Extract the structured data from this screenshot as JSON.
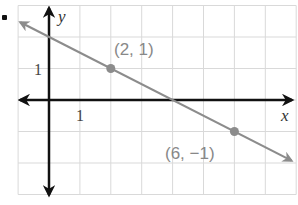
{
  "chart_data": {
    "type": "line",
    "title": "",
    "xlabel": "x",
    "ylabel": "y",
    "xlim": [
      -1,
      8
    ],
    "ylim": [
      -3,
      3
    ],
    "grid": true,
    "tick_labels": {
      "x": [
        "1"
      ],
      "y": [
        "1"
      ]
    },
    "series": [
      {
        "name": "line through (2, 1) and (6, -1)",
        "equation": "y = -0.5x + 2",
        "x": [
          -1,
          8
        ],
        "y": [
          2.5,
          -2
        ],
        "points": [
          {
            "x": 2,
            "y": 1,
            "label": "(2, 1)"
          },
          {
            "x": 6,
            "y": -1,
            "label": "(6, −1)"
          }
        ]
      }
    ],
    "colors": {
      "axes": "#111111",
      "line": "#8c8c8c",
      "grid": "#d9d9d9",
      "labels": "#888888"
    }
  },
  "labels": {
    "x_axis": "x",
    "y_axis": "y",
    "x_tick": "1",
    "y_tick": "1",
    "point1": "(2, 1)",
    "point2": "(6, −1)"
  }
}
